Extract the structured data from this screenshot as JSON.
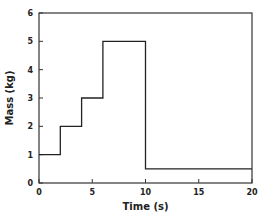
{
  "chart_data": {
    "type": "line",
    "style": "step",
    "title": "",
    "xlabel": "Time (s)",
    "ylabel": "Mass (kg)",
    "xlim": [
      0,
      20
    ],
    "ylim": [
      0,
      6
    ],
    "xticks": [
      0,
      5,
      10,
      15,
      20
    ],
    "yticks": [
      0,
      1,
      2,
      3,
      4,
      5,
      6
    ],
    "grid": false,
    "legend": null,
    "series": [
      {
        "name": "Mass",
        "x": [
          0,
          2,
          2,
          4,
          4,
          6,
          6,
          10,
          10,
          20
        ],
        "y": [
          1,
          1,
          2,
          2,
          3,
          3,
          5,
          5,
          0.5,
          0.5
        ]
      }
    ]
  },
  "colors": {
    "line": "#222222",
    "axes": "#333333",
    "background": "#ffffff"
  }
}
